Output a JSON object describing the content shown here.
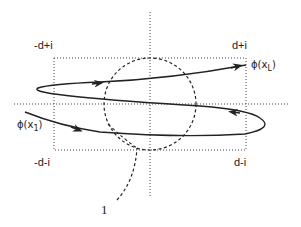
{
  "diagram": {
    "type": "contour",
    "labels": {
      "top_left_corner": "-d+i",
      "top_right_corner": "d+i",
      "bottom_left_corner": "-d-i",
      "bottom_right_corner": "d-i",
      "end_point_prefix": "ϕ(x",
      "end_point_sub": "L",
      "end_point_suffix": ")",
      "start_point_prefix": "ϕ(x",
      "start_point_sub": "1",
      "start_point_suffix": ")",
      "circle_label": "1"
    },
    "elements": [
      "dotted coordinate axes",
      "dotted rectangle with corners -d±i, d±i",
      "dashed unit circle centered at origin",
      "solid spiral path from ϕ(x1) to ϕ(xL) with arrows"
    ],
    "colors": {
      "stroke": "#222222"
    }
  }
}
